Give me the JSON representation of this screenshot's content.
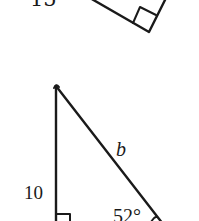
{
  "figures": [
    {
      "id": "top-triangle",
      "type": "right-triangle",
      "labels": {
        "side": "15"
      },
      "right_angle_marker": true,
      "partially_visible": true
    },
    {
      "id": "bottom-triangle",
      "type": "right-triangle",
      "labels": {
        "vertical_side": "10",
        "hypotenuse": "b",
        "angle": "52°"
      },
      "right_angle_marker": true,
      "partially_visible": true
    }
  ],
  "colors": {
    "stroke": "#1a1a1a",
    "background": "#ffffff"
  }
}
